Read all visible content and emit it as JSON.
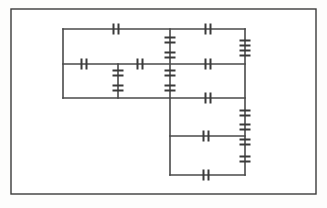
{
  "page": {
    "background_color": "#fdfdfc"
  },
  "frame": {
    "name": "diagram-border",
    "x": 11,
    "y": 9,
    "width": 305,
    "height": 185,
    "stroke": "#3b3b3b",
    "stroke_width": 1.4,
    "fill": "#ffffff"
  },
  "style": {
    "wire_color": "#4a4a4a",
    "wire_width": 1.6,
    "contact_color": "#3a3a3a",
    "contact_width": 2.0,
    "contact_bar_length": 11,
    "contact_gap": 5
  },
  "chart_data": {
    "type": "diagram",
    "wires": [
      {
        "id": "rail-left",
        "orientation": "vertical",
        "x": 63,
        "y1": 29,
        "y2": 98
      },
      {
        "id": "rung-top",
        "orientation": "horizontal",
        "y": 29,
        "x1": 63,
        "x2": 245
      },
      {
        "id": "rung-middle",
        "orientation": "horizontal",
        "y": 64,
        "x1": 63,
        "x2": 245
      },
      {
        "id": "rung-lower",
        "orientation": "horizontal",
        "y": 98,
        "x1": 63,
        "x2": 245
      },
      {
        "id": "branch-inner-left",
        "orientation": "vertical",
        "x": 118,
        "y1": 64,
        "y2": 98
      },
      {
        "id": "branch-center",
        "orientation": "vertical",
        "x": 170,
        "y1": 29,
        "y2": 175
      },
      {
        "id": "rail-right",
        "orientation": "vertical",
        "x": 245,
        "y1": 29,
        "y2": 175
      },
      {
        "id": "rung-bottom-mid",
        "orientation": "horizontal",
        "y": 136,
        "x1": 170,
        "x2": 245
      },
      {
        "id": "rung-bottom",
        "orientation": "horizontal",
        "y": 175,
        "x1": 170,
        "x2": 245
      }
    ],
    "contacts": [
      {
        "id": "contact-top-1",
        "orientation": "horizontal",
        "x": 116,
        "y": 29
      },
      {
        "id": "contact-top-2",
        "orientation": "horizontal",
        "x": 208,
        "y": 29
      },
      {
        "id": "contact-mid-1",
        "orientation": "horizontal",
        "x": 84,
        "y": 64
      },
      {
        "id": "contact-mid-2",
        "orientation": "horizontal",
        "x": 140,
        "y": 64
      },
      {
        "id": "contact-mid-3",
        "orientation": "horizontal",
        "x": 208,
        "y": 64
      },
      {
        "id": "contact-lower-1",
        "orientation": "horizontal",
        "x": 208,
        "y": 98
      },
      {
        "id": "contact-bottom-mid-1",
        "orientation": "horizontal",
        "x": 206,
        "y": 136
      },
      {
        "id": "contact-bottom-1",
        "orientation": "horizontal",
        "x": 206,
        "y": 175
      },
      {
        "id": "contact-vbranch-left-1",
        "orientation": "vertical",
        "x": 118,
        "y": 73
      },
      {
        "id": "contact-vbranch-left-2",
        "orientation": "vertical",
        "x": 118,
        "y": 88
      },
      {
        "id": "contact-vcenter-1",
        "orientation": "vertical",
        "x": 170,
        "y": 40
      },
      {
        "id": "contact-vcenter-2",
        "orientation": "vertical",
        "x": 170,
        "y": 55
      },
      {
        "id": "contact-vcenter-3",
        "orientation": "vertical",
        "x": 170,
        "y": 73
      },
      {
        "id": "contact-vcenter-4",
        "orientation": "vertical",
        "x": 170,
        "y": 88
      },
      {
        "id": "contact-vrail-1",
        "orientation": "vertical",
        "x": 245,
        "y": 43
      },
      {
        "id": "contact-vrail-2",
        "orientation": "vertical",
        "x": 245,
        "y": 53
      },
      {
        "id": "contact-vrail-3",
        "orientation": "vertical",
        "x": 245,
        "y": 113
      },
      {
        "id": "contact-vrail-4",
        "orientation": "vertical",
        "x": 245,
        "y": 127
      },
      {
        "id": "contact-vrail-5",
        "orientation": "vertical",
        "x": 245,
        "y": 142
      },
      {
        "id": "contact-vrail-6",
        "orientation": "vertical",
        "x": 245,
        "y": 159
      }
    ],
    "counts": {
      "wire_segments": 9,
      "horizontal_contacts": 8,
      "vertical_contacts": 12,
      "total_contacts": 20
    }
  }
}
